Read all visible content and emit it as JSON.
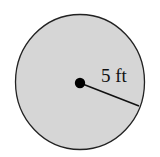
{
  "diagram": {
    "shape": "circle",
    "fill_color": "#d6d6d6",
    "stroke_color": "#222222",
    "radius_label": "5 ft",
    "center_point": "center-dot"
  }
}
